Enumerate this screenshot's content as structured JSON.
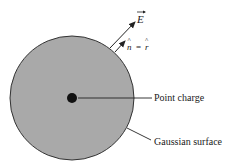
{
  "diagram": {
    "labels": {
      "electric_field": "E",
      "normal_equals_radial": "n = r",
      "normal": "n",
      "equals": "=",
      "radial": "r",
      "point_charge": "Point charge",
      "gaussian_surface": "Gaussian surface"
    },
    "colors": {
      "sphere_fill": "#a9a9a9",
      "sphere_stroke": "#333333",
      "charge": "#111111",
      "lines": "#222222",
      "background": "#ffffff"
    }
  }
}
